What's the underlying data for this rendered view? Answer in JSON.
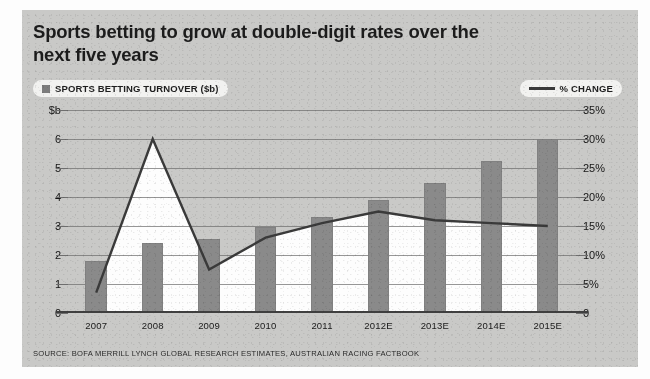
{
  "title": "Sports betting to grow at double-digit rates over the next five years",
  "legend": {
    "bars": "SPORTS BETTING TURNOVER ($b)",
    "line": "% CHANGE",
    "bar_marker": "filled-square-marker",
    "line_marker": "line-marker"
  },
  "source": "SOURCE: BOFA MERRILL LYNCH GLOBAL RESEARCH ESTIMATES, AUSTRALIAN RACING FACTBOOK",
  "colors": {
    "bar": "#8a8a8a",
    "line": "#3a3a3a",
    "background": "#c9c9c7",
    "plot_fill": "#fdfdfd",
    "grid": "#6e6e6e"
  },
  "chart_data": {
    "type": "bar",
    "title": "Sports betting to grow at double-digit rates over the next five years",
    "subtitle": "",
    "categories": [
      "2007",
      "2008",
      "2009",
      "2010",
      "2011",
      "2012E",
      "2013E",
      "2014E",
      "2015E"
    ],
    "series": [
      {
        "name": "SPORTS BETTING TURNOVER ($b)",
        "type": "bar",
        "axis": "left",
        "values": [
          1.8,
          2.4,
          2.55,
          2.95,
          3.3,
          3.9,
          4.5,
          5.25,
          6.0
        ]
      },
      {
        "name": "% CHANGE",
        "type": "line",
        "axis": "right",
        "values": [
          3.5,
          30.0,
          7.5,
          13.0,
          15.5,
          17.5,
          16.0,
          15.5,
          15.0
        ]
      }
    ],
    "xlabel": "",
    "ylabel": "$b",
    "ylabel_right": "%",
    "ylim": [
      0,
      7
    ],
    "ylim_right": [
      0,
      35
    ],
    "yticks_left": [
      "$b",
      "6",
      "5",
      "4",
      "3",
      "2",
      "1",
      "0"
    ],
    "yticks_right": [
      "35%",
      "30%",
      "25%",
      "20%",
      "15%",
      "10%",
      "5%",
      "0"
    ],
    "ytick_values": [
      7,
      6,
      5,
      4,
      3,
      2,
      1,
      0
    ],
    "grid": true,
    "legend_position": "top",
    "note": "Area below the % CHANGE line is shaded white against a grey newsprint background."
  }
}
